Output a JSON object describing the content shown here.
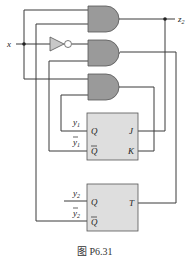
{
  "figure": {
    "caption": "图 P6.31",
    "input_label": "x",
    "output_label": "z",
    "output_subscript": "2"
  },
  "flipflop1": {
    "type": "JK",
    "out_q_label": "y",
    "out_q_sub": "1",
    "out_qbar_label": "y",
    "out_qbar_sub": "1",
    "pin_q": "Q",
    "pin_qbar": "Q",
    "pin_j": "J",
    "pin_k": "K"
  },
  "flipflop2": {
    "type": "T",
    "out_q_label": "y",
    "out_q_sub": "2",
    "out_qbar_label": "y",
    "out_qbar_sub": "2",
    "pin_q": "Q",
    "pin_qbar": "Q",
    "pin_t": "T"
  },
  "gates": [
    {
      "id": "and1",
      "type": "AND",
      "output": "z2 / J"
    },
    {
      "id": "and2",
      "type": "AND",
      "output": "T"
    },
    {
      "id": "and3",
      "type": "AND",
      "output": "K"
    }
  ],
  "inverter": {
    "type": "NOT",
    "input": "x"
  }
}
